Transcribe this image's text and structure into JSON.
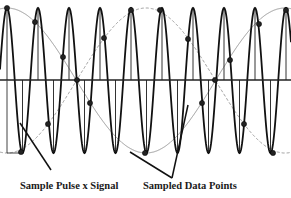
{
  "diagram": {
    "labels": {
      "pulse_signal": "Sample Pulse x Signal",
      "sampled_points": "Sampled Data Points"
    },
    "axis": {
      "y": 80,
      "x_start": 0,
      "x_end": 291
    },
    "carrier": {
      "x0": 7,
      "period": 31,
      "top": 8,
      "bottom": 153
    },
    "envelope": {
      "x0": 7,
      "period": 278,
      "top": 8,
      "bottom": 153
    },
    "sample_points": [
      [
        7,
        8
      ],
      [
        35,
        22
      ],
      [
        63,
        57
      ],
      [
        77,
        80
      ],
      [
        104,
        38
      ],
      [
        131,
        10
      ],
      [
        160,
        10
      ],
      [
        188,
        39
      ],
      [
        215,
        80
      ],
      [
        230,
        60
      ],
      [
        259,
        24
      ],
      [
        286,
        10
      ],
      [
        21,
        152
      ],
      [
        48,
        124
      ],
      [
        90,
        103
      ],
      [
        145,
        153
      ],
      [
        202,
        103
      ],
      [
        244,
        124
      ],
      [
        273,
        153
      ]
    ],
    "pointer_lines": [
      [
        [
          20,
          123
        ],
        [
          51,
          170
        ]
      ],
      [
        [
          130,
          152
        ],
        [
          172,
          178
        ]
      ],
      [
        [
          188,
          105
        ],
        [
          172,
          178
        ]
      ]
    ],
    "colors": {
      "carrier": "#111111",
      "envelope": "#9a9a9a",
      "axis": "#222222",
      "dot": "#222222"
    }
  }
}
